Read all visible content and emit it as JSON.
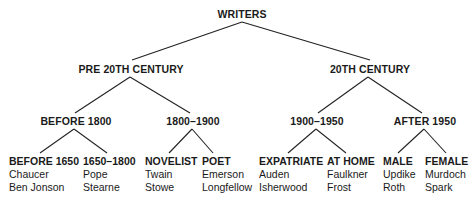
{
  "tree": {
    "root": "WRITERS",
    "level1": [
      {
        "label": "PRE 20TH CENTURY"
      },
      {
        "label": "20TH CENTURY"
      }
    ],
    "level2": [
      {
        "label": "BEFORE 1800"
      },
      {
        "label": "1800–1900"
      },
      {
        "label": "1900–1950"
      },
      {
        "label": "AFTER 1950"
      }
    ],
    "leaves": [
      {
        "label": "BEFORE 1650",
        "names": [
          "Chaucer",
          "Ben Jonson"
        ]
      },
      {
        "label": "1650–1800",
        "names": [
          "Pope",
          "Stearne"
        ]
      },
      {
        "label": "NOVELIST",
        "names": [
          "Twain",
          "Stowe"
        ]
      },
      {
        "label": "POET",
        "names": [
          "Emerson",
          "Longfellow"
        ]
      },
      {
        "label": "EXPATRIATE",
        "names": [
          "Auden",
          "Isherwood"
        ]
      },
      {
        "label": "AT HOME",
        "names": [
          "Faulkner",
          "Frost"
        ]
      },
      {
        "label": "MALE",
        "names": [
          "Updike",
          "Roth"
        ]
      },
      {
        "label": "FEMALE",
        "names": [
          "Murdoch",
          "Spark"
        ]
      }
    ]
  }
}
